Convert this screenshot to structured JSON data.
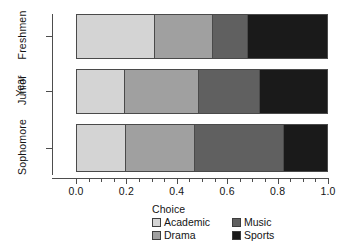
{
  "chart_data": {
    "type": "bar",
    "orientation": "horizontal",
    "stacked": true,
    "title": "",
    "xlabel": "",
    "ylabel": "Year",
    "legend_title": "Choice",
    "legend_position": "bottom",
    "grid": false,
    "xlim": [
      0.0,
      1.0
    ],
    "x_ticks": [
      "0.0",
      "0.2",
      "0.4",
      "0.6",
      "0.8",
      "1.0"
    ],
    "x_tick_values": [
      0.0,
      0.2,
      0.4,
      0.6,
      0.8,
      1.0
    ],
    "x_minor_tick_values": [
      0.05,
      0.1,
      0.15,
      0.25,
      0.3,
      0.35,
      0.45,
      0.5,
      0.55,
      0.65,
      0.7,
      0.75,
      0.85,
      0.9,
      0.95
    ],
    "categories": [
      "Freshmen",
      "Junior",
      "Sophomore"
    ],
    "series": [
      {
        "name": "Academic",
        "color": "#d4d4d4",
        "values": [
          0.31,
          0.19,
          0.195
        ]
      },
      {
        "name": "Drama",
        "color": "#a0a0a0",
        "values": [
          0.23,
          0.295,
          0.275
        ]
      },
      {
        "name": "Music",
        "color": "#606060",
        "values": [
          0.14,
          0.24,
          0.35
        ]
      },
      {
        "name": "Sports",
        "color": "#1a1a1a",
        "values": [
          0.32,
          0.275,
          0.18
        ]
      }
    ],
    "legend_entries": [
      {
        "label": "Academic",
        "color": "#d4d4d4"
      },
      {
        "label": "Music",
        "color": "#606060"
      },
      {
        "label": "Drama",
        "color": "#a0a0a0"
      },
      {
        "label": "Sports",
        "color": "#1a1a1a"
      }
    ]
  }
}
